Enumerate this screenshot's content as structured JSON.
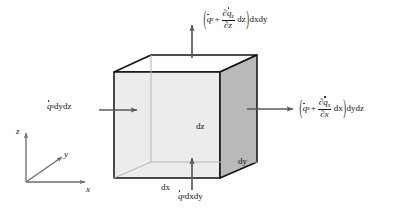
{
  "figure": {
    "background_color": "#fefefe",
    "cube": {
      "front_face_color": "#ececec",
      "right_face_color": "#b9b9b9",
      "top_face_color": "#fdfdfd",
      "outline_color": "#111111",
      "hidden_edge_color": "#b0b0b0"
    },
    "arrow_color": "#5a5a5a",
    "axis_color": "#6b6b6b"
  },
  "labels": {
    "flux_in_x": {
      "name": "q-dot-x dydz",
      "q": "q",
      "q_sub": "x",
      "tail": "dydz"
    },
    "flux_out_x": {
      "name": "q-dot-x plus partial derivative term dydz",
      "open_paren": "(",
      "q": "q",
      "q_sub": "x",
      "plus": "+",
      "num_partial": "∂",
      "num_q": "q",
      "num_q_sub": "x",
      "den_partial": "∂",
      "den_var": "x",
      "dvar": "dx",
      "close_paren": ")",
      "tail": "dydz"
    },
    "flux_in_z": {
      "name": "q-dot-z dxdy",
      "q": "q",
      "q_sub": "z",
      "tail": "dxdy"
    },
    "flux_out_z": {
      "name": "q-dot-z plus partial derivative term dxdy",
      "open_paren": "(",
      "q": "q",
      "q_sub": "z",
      "plus": "+",
      "num_partial": "∂",
      "num_q": "q",
      "num_q_sub": "z",
      "den_partial": "∂",
      "den_var": "z",
      "dvar": "dz",
      "close_paren": ")",
      "tail": "dxdy"
    },
    "dim_dx": "dx",
    "dim_dy": "dy",
    "dim_dz": "dz"
  },
  "axes": {
    "z": "z",
    "y": "y",
    "x": "x"
  }
}
